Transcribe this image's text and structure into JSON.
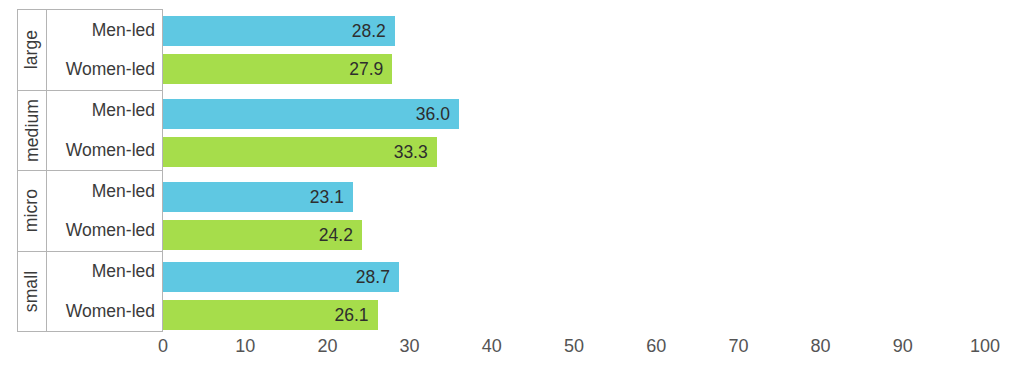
{
  "chart_data": {
    "type": "bar",
    "orientation": "horizontal",
    "title": "",
    "subtitle": "",
    "xlabel": "",
    "ylabel": "",
    "xlim": [
      0,
      100
    ],
    "xticks": [
      "0",
      "10",
      "20",
      "30",
      "40",
      "50",
      "60",
      "70",
      "80",
      "90",
      "100"
    ],
    "grid": false,
    "legend": "none",
    "categories": [
      "large",
      "medium",
      "micro",
      "small"
    ],
    "series": [
      {
        "name": "Men-led",
        "color": "#5fc8e2",
        "values": [
          28.2,
          36.0,
          23.1,
          28.7
        ]
      },
      {
        "name": "Women-led",
        "color": "#a6dd4b",
        "values": [
          27.9,
          33.3,
          24.2,
          26.1
        ]
      }
    ],
    "groups": [
      {
        "name": "large",
        "rows": [
          {
            "label": "Men-led",
            "value": 28.2,
            "value_text": "28.2",
            "color": "#5fc8e2",
            "series": "men"
          },
          {
            "label": "Women-led",
            "value": 27.9,
            "value_text": "27.9",
            "color": "#a6dd4b",
            "series": "women"
          }
        ]
      },
      {
        "name": "medium",
        "rows": [
          {
            "label": "Men-led",
            "value": 36.0,
            "value_text": "36.0",
            "color": "#5fc8e2",
            "series": "men"
          },
          {
            "label": "Women-led",
            "value": 33.3,
            "value_text": "33.3",
            "color": "#a6dd4b",
            "series": "women"
          }
        ]
      },
      {
        "name": "micro",
        "rows": [
          {
            "label": "Men-led",
            "value": 23.1,
            "value_text": "23.1",
            "color": "#5fc8e2",
            "series": "men"
          },
          {
            "label": "Women-led",
            "value": 24.2,
            "value_text": "24.2",
            "color": "#a6dd4b",
            "series": "women"
          }
        ]
      },
      {
        "name": "small",
        "rows": [
          {
            "label": "Men-led",
            "value": 28.7,
            "value_text": "28.7",
            "color": "#5fc8e2",
            "series": "men"
          },
          {
            "label": "Women-led",
            "value": 26.1,
            "value_text": "26.1",
            "color": "#a6dd4b",
            "series": "women"
          }
        ]
      }
    ]
  },
  "colors": {
    "men_led": "#5fc8e2",
    "women_led": "#a6dd4b",
    "text": "#3b3b3b",
    "axis_text": "#545454",
    "table_border": "#b4b4b4",
    "background": "#ffffff"
  }
}
